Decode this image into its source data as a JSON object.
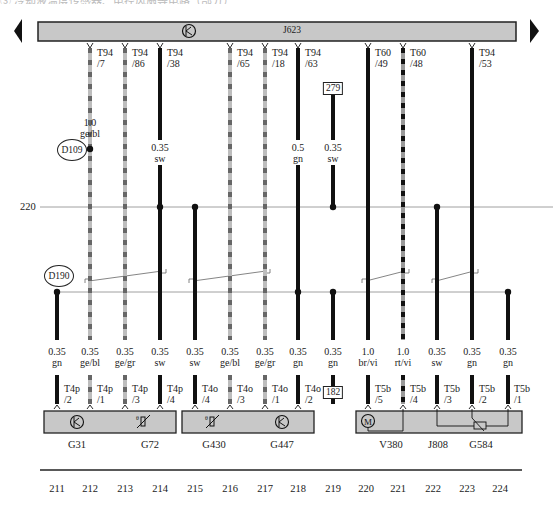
{
  "caption": "③ 冷却液温度传感器、电控风扇等电路（部分）",
  "module": {
    "name": "J623",
    "icon": "transistor-k-icon",
    "fill": "#c8c8c8"
  },
  "line_220": {
    "label": "220"
  },
  "connectors_top": [
    {
      "col": "212",
      "plug": "T94",
      "pin": "/7"
    },
    {
      "col": "213",
      "plug": "T94",
      "pin": "/86"
    },
    {
      "col": "214",
      "plug": "T94",
      "pin": "/38"
    },
    {
      "col": "216",
      "plug": "T94",
      "pin": "/65"
    },
    {
      "col": "217",
      "plug": "T94",
      "pin": "/18"
    },
    {
      "col": "218",
      "plug": "T94",
      "pin": "/63"
    },
    {
      "col": "220",
      "plug": "T60",
      "pin": "/49"
    },
    {
      "col": "221",
      "plug": "T60",
      "pin": "/48"
    },
    {
      "col": "223",
      "plug": "T94",
      "pin": "/53"
    }
  ],
  "upper_wires": [
    {
      "col": "212",
      "size": "1.0",
      "color": "ge/bl"
    },
    {
      "col": "214",
      "size": "0.35",
      "color": "sw"
    },
    {
      "col": "218",
      "size": "0.5",
      "color": "gn"
    },
    {
      "col": "219",
      "size": "0.35",
      "color": "sw"
    }
  ],
  "ref_boxes": {
    "top": "279",
    "bottom": "182"
  },
  "splices": {
    "upper": "D109",
    "lower": "D190"
  },
  "lower_wires": [
    {
      "col": "211",
      "size": "0.35",
      "color": "gn"
    },
    {
      "col": "212",
      "size": "0.35",
      "color": "ge/bl"
    },
    {
      "col": "213",
      "size": "0.35",
      "color": "ge/gr"
    },
    {
      "col": "214",
      "size": "0.35",
      "color": "sw"
    },
    {
      "col": "215",
      "size": "0.35",
      "color": "sw"
    },
    {
      "col": "216",
      "size": "0.35",
      "color": "ge/bl"
    },
    {
      "col": "217",
      "size": "0.35",
      "color": "ge/gr"
    },
    {
      "col": "218",
      "size": "0.35",
      "color": "gn"
    },
    {
      "col": "219",
      "size": "0.35",
      "color": "gn"
    },
    {
      "col": "220",
      "size": "1.0",
      "color": "br/vi"
    },
    {
      "col": "221",
      "size": "1.0",
      "color": "rt/vi"
    },
    {
      "col": "222",
      "size": "0.35",
      "color": "sw"
    },
    {
      "col": "223",
      "size": "0.35",
      "color": "gn"
    },
    {
      "col": "224",
      "size": "0.35",
      "color": "gn"
    }
  ],
  "connectors_bottom": [
    {
      "col": "211",
      "plug": "T4p",
      "pin": "/2"
    },
    {
      "col": "212",
      "plug": "T4p",
      "pin": "/1"
    },
    {
      "col": "213",
      "plug": "T4p",
      "pin": "/3"
    },
    {
      "col": "214",
      "plug": "T4p",
      "pin": "/4"
    },
    {
      "col": "215",
      "plug": "T4o",
      "pin": "/4"
    },
    {
      "col": "216",
      "plug": "T4o",
      "pin": "/3"
    },
    {
      "col": "217",
      "plug": "T4o",
      "pin": "/1"
    },
    {
      "col": "218",
      "plug": "T4o",
      "pin": "/2"
    },
    {
      "col": "220",
      "plug": "T5b",
      "pin": "/5"
    },
    {
      "col": "221",
      "plug": "T5b",
      "pin": "/4"
    },
    {
      "col": "222",
      "plug": "T5b",
      "pin": "/3"
    },
    {
      "col": "223",
      "plug": "T5b",
      "pin": "/2"
    },
    {
      "col": "224",
      "plug": "T5b",
      "pin": "/1"
    }
  ],
  "components": [
    {
      "name": "G31",
      "icon": "transistor-k-icon"
    },
    {
      "name": "G72",
      "icon": "temperature-sensor-icon"
    },
    {
      "name": "G430",
      "icon": "temperature-sensor-icon"
    },
    {
      "name": "G447",
      "icon": "transistor-k-icon"
    },
    {
      "name": "V380",
      "icon": "motor-icon"
    },
    {
      "name": "J808",
      "icon": ""
    },
    {
      "name": "G584",
      "icon": "potentiometer-icon"
    }
  ],
  "columns": [
    "211",
    "212",
    "213",
    "214",
    "215",
    "216",
    "217",
    "218",
    "219",
    "220",
    "221",
    "222",
    "223",
    "224"
  ]
}
